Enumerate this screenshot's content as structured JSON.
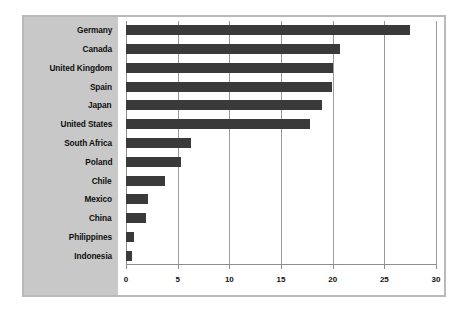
{
  "chart_data": {
    "type": "bar",
    "orientation": "horizontal",
    "title": "",
    "subtitle": "",
    "xlabel": "",
    "ylabel": "",
    "categories": [
      "Germany",
      "Canada",
      "United Kingdom",
      "Spain",
      "Japan",
      "United States",
      "South Africa",
      "Poland",
      "Chile",
      "Mexico",
      "China",
      "Philippines",
      "Indonesia"
    ],
    "values": [
      27.5,
      20.7,
      20.0,
      19.9,
      19.0,
      17.8,
      6.3,
      5.3,
      3.8,
      2.1,
      1.9,
      0.8,
      0.6
    ],
    "xlim": [
      0,
      30
    ],
    "xticks": [
      0,
      5,
      10,
      15,
      20,
      25,
      30
    ],
    "xtick_labels": [
      "0",
      "5",
      "10",
      "15",
      "20",
      "25",
      "30"
    ],
    "grid": true,
    "grid_axis": "x",
    "legend": false,
    "legend_position": "none",
    "bar_color": "#3a3a3a",
    "panel_color": "#c8c8c8",
    "plot_background": "#ffffff",
    "frame_color": "#b9b9b9",
    "gridline_color": "#9a9a9a"
  }
}
